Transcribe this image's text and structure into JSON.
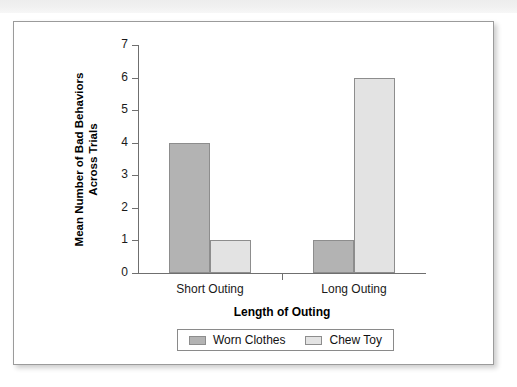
{
  "chart_data": {
    "type": "bar",
    "title": "",
    "categories": [
      "Short Outing",
      "Long Outing"
    ],
    "series": [
      {
        "name": "Worn Clothes",
        "values": [
          4,
          1
        ],
        "color": "#b3b3b3"
      },
      {
        "name": "Chew Toy",
        "values": [
          1,
          6
        ],
        "color": "#e3e3e3"
      }
    ],
    "bars": [
      {
        "category": "Short Outing",
        "series": "Worn Clothes",
        "value": 4
      },
      {
        "category": "Short Outing",
        "series": "Chew Toy",
        "value": 1
      },
      {
        "category": "Long Outing",
        "series": "Worn Clothes",
        "value": 2
      },
      {
        "category": "Long Outing",
        "series": "Chew Toy",
        "value": 6
      }
    ],
    "xlabel": "Length of Outing",
    "ylabel": "Mean Number of Bad Behaviors Across Trials",
    "ylabel_lines": [
      "Mean Number of Bad Behaviors",
      "Across Trials"
    ],
    "ylim": [
      0,
      7
    ],
    "yticks": [
      0,
      1,
      2,
      3,
      4,
      5,
      6,
      7
    ],
    "ytick_labels": [
      "0",
      "1",
      "2",
      "3",
      "4",
      "5",
      "6",
      "7"
    ],
    "grid": false,
    "legend_position": "bottom",
    "legend_entries": [
      "Worn Clothes",
      "Chew Toy"
    ]
  },
  "figure": {
    "background": "#ffffff",
    "border_color": "#9b9b9b"
  },
  "colors": {
    "series_worn_clothes": "#b3b3b3",
    "series_chew_toy": "#e3e3e3",
    "axis": "#6f6f6f",
    "text": "#1a1a1a"
  }
}
